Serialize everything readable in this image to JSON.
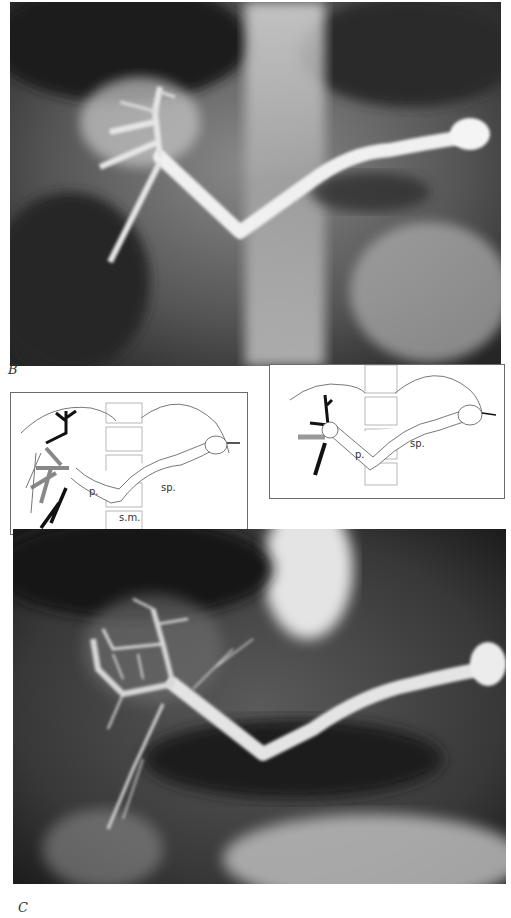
{
  "figure": {
    "panels": [
      {
        "id": "B",
        "label": "B",
        "type": "radiograph",
        "description": "Splenoportogram: contrast-filled splenic vein joining portal vein"
      },
      {
        "id": "C",
        "label": "C",
        "type": "radiograph",
        "description": "Later-phase splenoportogram with intrahepatic portal branches"
      }
    ],
    "diagrams": [
      {
        "id": "diagram-left",
        "labels": {
          "portal": "p.",
          "splenic": "sp.",
          "superior_mesenteric": "s.m."
        }
      },
      {
        "id": "diagram-right",
        "labels": {
          "portal": "p.",
          "splenic": "sp."
        }
      }
    ]
  },
  "colors": {
    "film_dark": "#1e1e1e",
    "film_mid": "#6e6e6e",
    "contrast_white": "#f2f2f2",
    "line": "#555555",
    "ink": "#111111"
  }
}
